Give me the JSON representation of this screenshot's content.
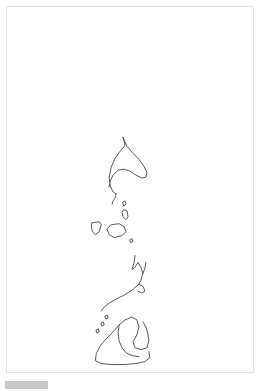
{
  "document": {
    "title": "",
    "background_color": "#ffffff",
    "page_color": "#ffffff",
    "page_border_color": "#e3e3e3"
  },
  "sketch": {
    "name": "philippines-archipelago-sketch",
    "description": "Hand-drawn pencil outline map of the Philippine islands",
    "stroke_color": "#5a5a5a",
    "stroke_color_light": "#8d8d8d",
    "stroke_width": 1,
    "fill": "none",
    "viewbox": "0 0 248 367",
    "shapes": [
      {
        "name": "luzon",
        "label": "Luzon",
        "path": "M 117 131 L 119 139 L 114 145 L 109 152 L 105 161 L 103 171 L 104 180 L 107 186 L 110 188 M 117 131 L 121 140 L 127 147 L 133 153 L 138 160 L 141 166 L 140 171 L 136 172 L 130 169 L 124 165 L 118 163 L 112 164 L 107 169 L 104 175 L 103 181"
      },
      {
        "name": "bicol-tail",
        "label": "Bicol peninsula tail",
        "path": "M 110 188 L 109 192 L 107 195 L 106 198"
      },
      {
        "name": "island-marinduque",
        "label": "small island below Luzon",
        "path": "M 117 196 L 119 195 L 120 198 L 118 200 Z"
      },
      {
        "name": "island-catanduanes",
        "label": "narrow island",
        "path": "M 118 204 L 121 205 L 122 211 L 120 214 L 117 211 L 116 207 Z"
      },
      {
        "name": "island-mindoro",
        "label": "Mindoro",
        "path": "M 86 217 L 93 216 L 95 219 L 93 226 L 89 229 L 86 226 L 85 221 Z"
      },
      {
        "name": "island-panay",
        "label": "Panay / Visayas block",
        "path": "M 105 219 L 113 218 L 118 221 L 120 226 L 116 230 L 108 232 L 103 229 L 101 224 Z"
      },
      {
        "name": "island-negros-dot",
        "label": "tiny island dot",
        "path": "M 124 234 L 126 233 L 127 236 L 125 237 Z"
      },
      {
        "name": "visayas-zigzag",
        "label": "Cebu / Leyte zigzag",
        "path": "M 129 250 L 128 258 L 126 264 L 129 262 L 132 257 L 135 262 L 137 268 L 139 263 L 140 257 M 137 268 L 135 275 L 133 279"
      },
      {
        "name": "palawan-diagonal",
        "label": "Palawan long diagonal",
        "path": "M 133 279 L 126 285 L 118 290 L 110 294 L 103 298 L 98 302 L 95 306"
      },
      {
        "name": "samar-leyte-hook",
        "label": "hook beside zigzag",
        "path": "M 133 279 L 137 281 L 139 286 L 136 288 L 132 286"
      },
      {
        "name": "sulu-dots",
        "label": "small southern dots",
        "path": "M 99 311 L 101 310 L 102 313 L 100 314 Z M 95 318 L 97 317 L 98 320 L 96 321 Z M 90 325 L 92 324 L 93 327 L 91 328 Z"
      },
      {
        "name": "mindanao",
        "label": "Mindanao",
        "path": "M 119 315 L 126 312 L 131 315 L 133 322 L 131 330 L 127 337 L 129 343 L 135 345 L 141 343 L 143 336 L 142 329 L 140 322 L 137 317 M 119 315 L 113 320 L 107 327 L 100 334 L 94 341 L 90 349 L 89 356 L 95 359 L 106 360 L 118 360 L 130 359 L 139 357 L 144 353 L 143 347"
      },
      {
        "name": "mindanao-inner",
        "label": "Mindanao interior line",
        "path": "M 113 320 L 112 328 L 113 336 L 116 343 L 120 348 L 126 351 L 133 352"
      }
    ]
  },
  "footer": {
    "bar_color": "#c9c9c9",
    "label": ""
  }
}
